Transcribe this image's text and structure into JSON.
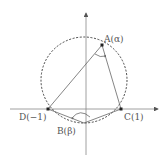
{
  "diagram": {
    "type": "complex-plane geometry",
    "points": {
      "A": {
        "label": "A(α)",
        "x": 102,
        "y": 45
      },
      "B": {
        "label": "B(β)",
        "x": 84,
        "y": 123
      },
      "C": {
        "label": "C(1)",
        "x": 121,
        "y": 109
      },
      "D": {
        "label": "D(−1)",
        "x": 48,
        "y": 109
      }
    },
    "circle": {
      "cx": 84,
      "cy": 80,
      "r": 43,
      "style": "dashed"
    },
    "segments": [
      "DA",
      "AC",
      "DB",
      "BC"
    ],
    "angles_marked": [
      "DAC at A",
      "DBC at B"
    ],
    "axes": {
      "x": "horizontal axis with arrow",
      "y": "vertical axis with arrow"
    },
    "colors": {
      "line": "#666666",
      "point": "#222222",
      "label": "#555555"
    }
  }
}
